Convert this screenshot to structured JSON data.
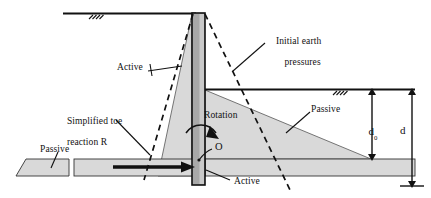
{
  "figure": {
    "type": "engineering-diagram",
    "background_color": "#ffffff",
    "line_color": "#111111",
    "soil_fill_color": "#d8d8d8",
    "wall_fill_color": "#a8a8a8",
    "pressure_fill_color": "#d4d4d4"
  },
  "labels": {
    "initial_earth_pressures": "Initial earth\npressures",
    "initial_earth_pressures_line1": "Initial earth",
    "initial_earth_pressures_line2": "pressures",
    "active_upper": "Active",
    "active_lower": "Active",
    "simplified_toe_reaction_line1": "Simplified toe",
    "simplified_toe_reaction_line2": "reaction R",
    "rotation": "Rotation",
    "rotation_point": "O",
    "passive_left": "Passive",
    "passive_right": "Passive",
    "depth_d0": "d",
    "depth_d0_subscript": "0",
    "depth_d": "d"
  },
  "dimensions": {
    "d0_label": "d0",
    "d_label": "d",
    "d0_description": "Depth from excavation level to base of passive pressure triangle",
    "d_description": "Total embedment depth of wall below excavation level"
  },
  "elements": {
    "wall": "vertical-retaining-wall",
    "ground_surface_left": "retained-ground-level",
    "excavation_level_right": "excavation-formation-level",
    "toe_reaction_arrow": "simplified-toe-reaction-R",
    "rotation_arrow": "rotation-direction-arrow",
    "active_pressure_triangle": "active-earth-pressure-wedge",
    "passive_pressure_triangle": "passive-earth-pressure-wedge",
    "initial_pressure_dashed_left": "initial-active-pressure-dashed-line",
    "initial_pressure_dashed_right": "initial-passive-pressure-dashed-line"
  }
}
